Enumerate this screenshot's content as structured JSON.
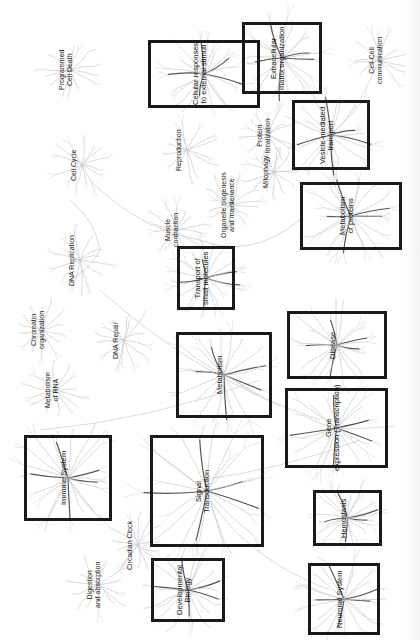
{
  "orientation": "rotated -90deg; labels read bottom-to-top",
  "colors": {
    "box_border": "#1a1a1a",
    "branch_light": "#c8c8c8",
    "branch_dark": "#555555",
    "background": "#ffffff"
  },
  "boxed_pathways": [
    {
      "id": "cellular-responses",
      "label": "Cellular responses\nto external stimuli",
      "x": 148,
      "y": 40,
      "w": 112,
      "h": 68
    },
    {
      "id": "extracellular-matrix",
      "label": "Extracellular\nmatrix organization",
      "x": 242,
      "y": 22,
      "w": 80,
      "h": 72
    },
    {
      "id": "vesicle-transport",
      "label": "Vesicle-mediated\ntransport",
      "x": 292,
      "y": 100,
      "w": 78,
      "h": 70
    },
    {
      "id": "metabolism-proteins",
      "label": "Metabolism\nof proteins",
      "x": 300,
      "y": 182,
      "w": 102,
      "h": 68
    },
    {
      "id": "transport-small-molecules",
      "label": "Transport of\nsmall molecules",
      "x": 177,
      "y": 246,
      "w": 58,
      "h": 64
    },
    {
      "id": "metabolism",
      "label": "Metabolism",
      "x": 176,
      "y": 332,
      "w": 96,
      "h": 86
    },
    {
      "id": "disease",
      "label": "Disease",
      "x": 287,
      "y": 311,
      "w": 100,
      "h": 68
    },
    {
      "id": "gene-expression",
      "label": "Gene\nexpression (Transcription)",
      "x": 285,
      "y": 388,
      "w": 103,
      "h": 80
    },
    {
      "id": "immune-system",
      "label": "Immune System",
      "x": 24,
      "y": 435,
      "w": 88,
      "h": 86
    },
    {
      "id": "signal-transduction",
      "label": "Signal\nTransduction",
      "x": 150,
      "y": 435,
      "w": 114,
      "h": 112
    },
    {
      "id": "hemostasis",
      "label": "Hemostasis",
      "x": 313,
      "y": 490,
      "w": 69,
      "h": 56
    },
    {
      "id": "developmental-biology",
      "label": "Developmental\nBiology",
      "x": 151,
      "y": 558,
      "w": 74,
      "h": 64
    },
    {
      "id": "neuronal-system",
      "label": "Neuronal System",
      "x": 308,
      "y": 563,
      "w": 72,
      "h": 72
    }
  ],
  "free_pathways": [
    {
      "id": "programmed-cell-death",
      "label": "Programmed\nCell Death",
      "x": 58,
      "y": 70
    },
    {
      "id": "cell-cell-communication",
      "label": "Cell-Cell\ncommunication",
      "x": 150,
      "y": 60,
      "relx": 368
    },
    {
      "id": "cell-cycle",
      "label": "Cell Cycle",
      "x": 70,
      "y": 165
    },
    {
      "id": "reproduction",
      "label": "Reproduction",
      "x": 175,
      "y": 150
    },
    {
      "id": "protein-localization",
      "label": "Protein\nlocalization",
      "x": 256,
      "y": 135
    },
    {
      "id": "mitophagy",
      "label": "Mitophagy",
      "x": 262,
      "y": 172
    },
    {
      "id": "organelle-biogenesis",
      "label": "Organelle biogenesis\nand maintenance",
      "x": 220,
      "y": 205
    },
    {
      "id": "muscle-contraction",
      "label": "Muscle\ncontraction",
      "x": 164,
      "y": 230
    },
    {
      "id": "dna-replication",
      "label": "DNA Replication",
      "x": 68,
      "y": 260
    },
    {
      "id": "chromatin-organization",
      "label": "Chromatin\norganization",
      "x": 30,
      "y": 330
    },
    {
      "id": "dna-repair",
      "label": "DNA Repair",
      "x": 112,
      "y": 340
    },
    {
      "id": "metabolism-rna",
      "label": "Metabolism\nof RNA",
      "x": 44,
      "y": 390
    },
    {
      "id": "circadian-clock",
      "label": "Circadian Clock",
      "x": 126,
      "y": 545
    },
    {
      "id": "digestion-absorption",
      "label": "Digestion\nand absorption",
      "x": 86,
      "y": 585
    }
  ]
}
